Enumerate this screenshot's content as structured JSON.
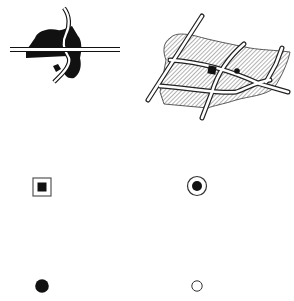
{
  "figure": {
    "panels": [
      {
        "id": "small-scale-map",
        "description": "Built-up area shown as solid black area crossed by roads"
      },
      {
        "id": "large-scale-map",
        "description": "Built-up area shown as hatched area with street grid and point features"
      }
    ],
    "symbols": [
      {
        "id": "square-in-square",
        "shape": "filled square inside outlined square"
      },
      {
        "id": "circle-dot",
        "shape": "filled dot inside outlined circle"
      },
      {
        "id": "filled-dot",
        "shape": "filled black circle"
      },
      {
        "id": "hollow-circle",
        "shape": "outlined white circle"
      }
    ],
    "colors": {
      "ink": "#111111",
      "paper": "#ffffff",
      "hatch": "#555555"
    }
  }
}
